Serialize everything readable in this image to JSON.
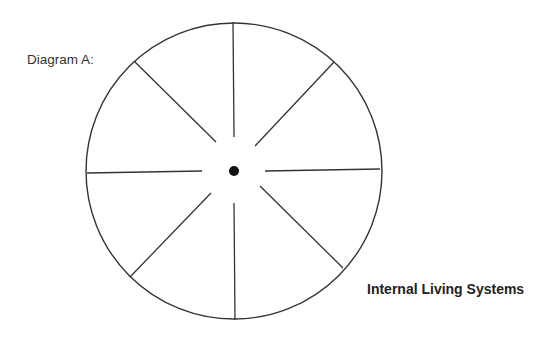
{
  "diagram": {
    "label": "Diagram A:",
    "caption": "Internal Living Systems",
    "colors": {
      "stroke": "#333333",
      "dot": "#111111",
      "background": "#ffffff"
    },
    "circle": {
      "cx": 234,
      "cy": 171,
      "r": 148
    },
    "center_dot": {
      "cx": 234,
      "cy": 171,
      "r": 5
    },
    "spokes": [
      {
        "name": "north",
        "x1": 233,
        "y1": 22,
        "x2": 234,
        "y2": 137
      },
      {
        "name": "northeast",
        "x1": 334,
        "y1": 62,
        "x2": 255,
        "y2": 146
      },
      {
        "name": "east",
        "x1": 380,
        "y1": 169,
        "x2": 265,
        "y2": 171
      },
      {
        "name": "southeast",
        "x1": 343,
        "y1": 268,
        "x2": 260,
        "y2": 186
      },
      {
        "name": "south",
        "x1": 235,
        "y1": 320,
        "x2": 234,
        "y2": 203
      },
      {
        "name": "southwest",
        "x1": 130,
        "y1": 277,
        "x2": 211,
        "y2": 193
      },
      {
        "name": "west",
        "x1": 87,
        "y1": 173,
        "x2": 202,
        "y2": 171
      },
      {
        "name": "northwest",
        "x1": 134,
        "y1": 61,
        "x2": 216,
        "y2": 142
      }
    ]
  }
}
